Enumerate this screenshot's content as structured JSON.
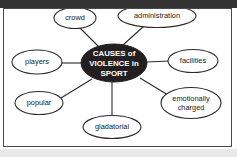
{
  "canvas": {
    "width": 237,
    "height": 157,
    "background_color": "#ffffff",
    "top_band_color": "#333333",
    "bottom_band_color": "#e9e9e9",
    "frame_border_color": "#4a4a4a"
  },
  "diagram": {
    "type": "mind-map",
    "center": {
      "label_lines": [
        "CAUSES of",
        "VIOLENCE in",
        "SPORT"
      ],
      "line1": "CAUSES of",
      "line2": "VIOLENCE in",
      "line3": "SPORT",
      "fill_color": "#231f20",
      "text_color": "#ffffff",
      "cx": 111,
      "cy": 62,
      "rx": 33,
      "ry": 19
    },
    "nodes": [
      {
        "id": "crowd",
        "label_lines": [
          "crowd"
        ],
        "line1": "crowd",
        "cx": 74,
        "cy": 15,
        "rx": 21,
        "ry": 10.5
      },
      {
        "id": "administration",
        "label_lines": [
          "administration"
        ],
        "line1": "administration",
        "cx": 153,
        "cy": 13,
        "rx": 39,
        "ry": 11.5
      },
      {
        "id": "players",
        "label_lines": [
          "players"
        ],
        "line1": "players",
        "cx": 40,
        "cy": 59,
        "rx": 25,
        "ry": 12
      },
      {
        "id": "facilities",
        "label_lines": [
          "facilities"
        ],
        "line1": "facilities",
        "cx": 191,
        "cy": 58,
        "rx": 25,
        "ry": 11.5
      },
      {
        "id": "popular",
        "label_lines": [
          "popular"
        ],
        "line1": "popular",
        "cx": 42,
        "cy": 100,
        "rx": 24,
        "ry": 11.5
      },
      {
        "id": "emotionally-charged",
        "label_lines": [
          "emotionally",
          "charged"
        ],
        "line1": "emotionally",
        "line2": "charged",
        "cx": 189,
        "cy": 99,
        "rx": 30,
        "ry": 15.5
      },
      {
        "id": "gladatorial",
        "label_lines": [
          "gladatorial"
        ],
        "line1": "gladatorial",
        "cx": 112,
        "cy": 123,
        "rx": 29,
        "ry": 11.5
      }
    ]
  }
}
